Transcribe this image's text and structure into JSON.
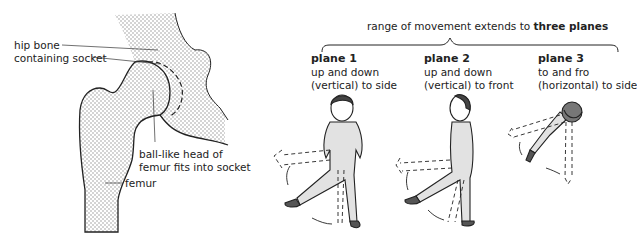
{
  "hip_diagram": {
    "labels": {
      "hip_bone_line1": "hip bone",
      "hip_bone_line2": "containing socket",
      "ball_line1": "ball-like head of",
      "ball_line2": "femur fits into socket",
      "femur": "femur"
    }
  },
  "movement": {
    "banner_prefix": "range of movement extends to ",
    "banner_bold": "three planes",
    "planes": [
      {
        "title": "plane 1",
        "line1": "up and down",
        "line2": "(vertical) to side"
      },
      {
        "title": "plane 2",
        "line1": "up and down",
        "line2": "(vertical) to front"
      },
      {
        "title": "plane 3",
        "line1": "to and fro",
        "line2": "(horizontal) to side"
      }
    ]
  },
  "colors": {
    "stipple": "#9a9a9a",
    "figure_fill": "#e2e2e2",
    "outline": "#222222",
    "shoe": "#555555"
  }
}
